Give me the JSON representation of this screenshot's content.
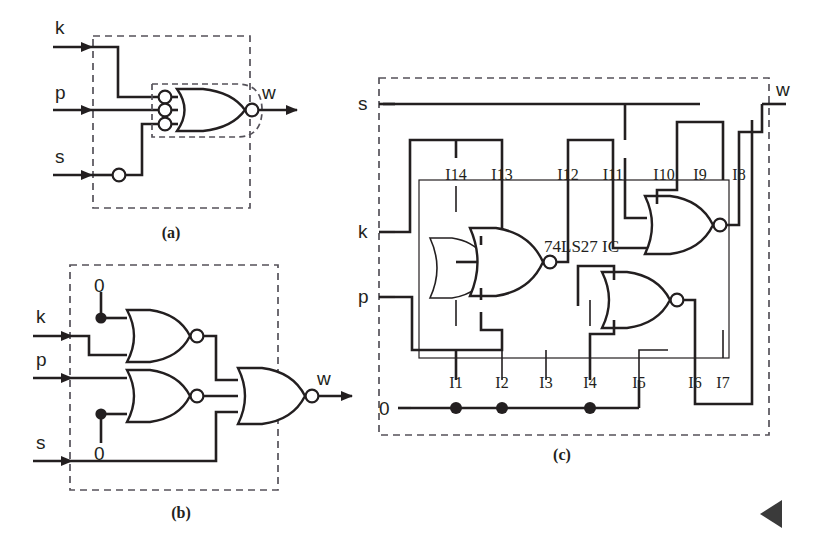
{
  "figure": {
    "type": "logic-circuit-diagram",
    "background_color": "#ffffff",
    "ink_color": "#231f20",
    "panels": [
      {
        "id": "a",
        "caption": "(a)",
        "description": "Single OR gate with inverting bubbles on all three inputs and an inverting bubble on the output (equivalent to a NOR-of-complements); input s passes through an inverter bubble.",
        "inputs": [
          "k",
          "p",
          "s"
        ],
        "outputs": [
          "w"
        ],
        "gates": [
          {
            "kind": "or",
            "inputs": 3,
            "input_bubbles": true,
            "output_bubble": true
          }
        ],
        "inline_inverters": 1
      },
      {
        "id": "b",
        "caption": "(b)",
        "description": "Three 2-/3-input NOR gates; constant 0 tied to one input of the top NOR and one input of the middle NOR; outputs combine in a final NOR with s.",
        "inputs": [
          "k",
          "p",
          "s"
        ],
        "outputs": [
          "w"
        ],
        "constants": [
          "0",
          "0"
        ],
        "gates": [
          {
            "kind": "nor",
            "inputs": 3,
            "label": "top"
          },
          {
            "kind": "nor",
            "inputs": 3,
            "label": "middle"
          },
          {
            "kind": "nor",
            "inputs": 3,
            "label": "output"
          }
        ]
      },
      {
        "id": "c",
        "caption": "(c)",
        "chip_label": "74LS27 IC",
        "description": "74LS27 triple 3-input NOR IC wiring diagram with numbered pins; unused pins tied to logic 0 rail.",
        "inputs": [
          "s",
          "k",
          "p"
        ],
        "outputs": [
          "w"
        ],
        "ground_label": "0",
        "pins_top": [
          "I14",
          "I13",
          "I12",
          "I11",
          "I10",
          "I9",
          "I8"
        ],
        "pins_bottom": [
          "I1",
          "I2",
          "I3",
          "I4",
          "I5",
          "I6",
          "I7"
        ],
        "junction_pins": [
          "I1",
          "I2",
          "I4"
        ],
        "gates": [
          {
            "kind": "nor",
            "inputs": 3,
            "label": "gate-left"
          },
          {
            "kind": "nor",
            "inputs": 3,
            "label": "gate-middle"
          },
          {
            "kind": "nor",
            "inputs": 3,
            "label": "gate-right"
          }
        ]
      }
    ],
    "corner_marker": "left-pointing-triangle"
  },
  "labels": {
    "k": "k",
    "p": "p",
    "s": "s",
    "w": "w",
    "zero": "0",
    "cap_a": "(a)",
    "cap_b": "(b)",
    "cap_c": "(c)",
    "chip": "74LS27 IC",
    "i1": "I1",
    "i2": "I2",
    "i3": "I3",
    "i4": "I4",
    "i5": "I5",
    "i6": "I6",
    "i7": "I7",
    "i8": "I8",
    "i9": "I9",
    "i10": "I10",
    "i11": "I11",
    "i12": "I12",
    "i13": "I13",
    "i14": "I14"
  }
}
